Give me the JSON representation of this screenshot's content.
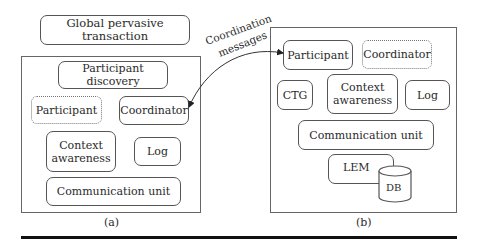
{
  "title_box": {
    "label": "Global pervasive transaction"
  },
  "panel_a": {
    "caption": "(a)",
    "participant_discovery": "Participant discovery",
    "participant": "Participant",
    "coordinator": "Coordinator",
    "context_awareness_line1": "Context",
    "context_awareness_line2": "awareness",
    "log": "Log",
    "communication_unit": "Communication unit"
  },
  "panel_b": {
    "caption": "(b)",
    "participant": "Participant",
    "coordinator": "Coordinator",
    "ctg": "CTG",
    "context_awareness_line1": "Context",
    "context_awareness_line2": "awareness",
    "log": "Log",
    "communication_unit": "Communication unit",
    "lem": "LEM",
    "db": "DB"
  },
  "arrow": {
    "label_line1": "Coordination",
    "label_line2": "messages"
  }
}
